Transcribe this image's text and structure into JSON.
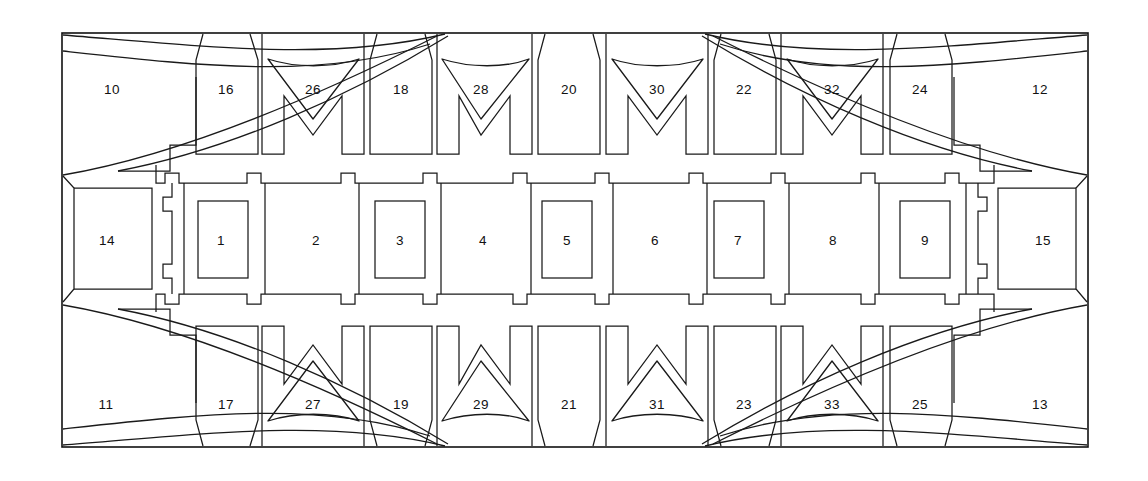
{
  "figure": {
    "kind": "technical-line-drawing",
    "background_color": "#ffffff",
    "line_color": "#111111",
    "frame": {
      "x": 62,
      "y": 33,
      "width": 1026,
      "height": 414
    }
  },
  "bands": {
    "top": {
      "y": 33,
      "height": 132,
      "label_y": 90,
      "cells": [
        {
          "label": "10",
          "cx": 112,
          "type": "corner-swept-left"
        },
        {
          "label": "16",
          "cx": 226,
          "type": "plain-tongue"
        },
        {
          "label": "26",
          "cx": 313,
          "type": "chevron-down"
        },
        {
          "label": "18",
          "cx": 401,
          "type": "plain-tongue"
        },
        {
          "label": "28",
          "cx": 481,
          "type": "chevron-down"
        },
        {
          "label": "20",
          "cx": 569,
          "type": "plain-tongue"
        },
        {
          "label": "30",
          "cx": 657,
          "type": "chevron-down"
        },
        {
          "label": "22",
          "cx": 744,
          "type": "plain-tongue"
        },
        {
          "label": "32",
          "cx": 832,
          "type": "chevron-down"
        },
        {
          "label": "24",
          "cx": 920,
          "type": "plain-tongue"
        },
        {
          "label": "12",
          "cx": 1040,
          "type": "corner-swept-right"
        }
      ]
    },
    "middle": {
      "y": 165,
      "height": 147,
      "label_y": 241,
      "side_cells": [
        {
          "label": "14",
          "cx": 107,
          "side": "left"
        },
        {
          "label": "15",
          "cx": 1043,
          "side": "right"
        }
      ],
      "inner_cells": [
        {
          "label": "1",
          "cx": 221,
          "has_inner_rect": true
        },
        {
          "label": "2",
          "cx": 316,
          "has_inner_rect": false
        },
        {
          "label": "3",
          "cx": 400,
          "has_inner_rect": true
        },
        {
          "label": "4",
          "cx": 483,
          "has_inner_rect": false
        },
        {
          "label": "5",
          "cx": 567,
          "has_inner_rect": true
        },
        {
          "label": "6",
          "cx": 655,
          "has_inner_rect": false
        },
        {
          "label": "7",
          "cx": 738,
          "has_inner_rect": true
        },
        {
          "label": "8",
          "cx": 833,
          "has_inner_rect": false
        },
        {
          "label": "9",
          "cx": 925,
          "has_inner_rect": true
        }
      ]
    },
    "bottom": {
      "y": 312,
      "height": 135,
      "label_y": 405,
      "cells": [
        {
          "label": "11",
          "cx": 106,
          "type": "corner-swept-left"
        },
        {
          "label": "17",
          "cx": 226,
          "type": "plain-tongue"
        },
        {
          "label": "27",
          "cx": 313,
          "type": "chevron-up"
        },
        {
          "label": "19",
          "cx": 401,
          "type": "plain-tongue"
        },
        {
          "label": "29",
          "cx": 481,
          "type": "chevron-up"
        },
        {
          "label": "21",
          "cx": 569,
          "type": "plain-tongue"
        },
        {
          "label": "31",
          "cx": 657,
          "type": "chevron-up"
        },
        {
          "label": "23",
          "cx": 744,
          "type": "plain-tongue"
        },
        {
          "label": "33",
          "cx": 832,
          "type": "chevron-up"
        },
        {
          "label": "25",
          "cx": 920,
          "type": "plain-tongue"
        },
        {
          "label": "13",
          "cx": 1040,
          "type": "corner-swept-right"
        }
      ]
    }
  },
  "all_labels": [
    "1",
    "2",
    "3",
    "4",
    "5",
    "6",
    "7",
    "8",
    "9",
    "10",
    "11",
    "12",
    "13",
    "14",
    "15",
    "16",
    "17",
    "18",
    "19",
    "20",
    "21",
    "22",
    "23",
    "24",
    "25",
    "26",
    "27",
    "28",
    "29",
    "30",
    "31",
    "32",
    "33"
  ]
}
